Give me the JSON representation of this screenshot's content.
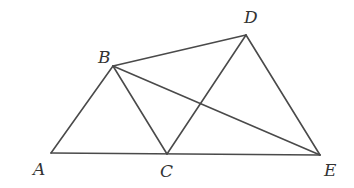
{
  "diagram": {
    "stroke_color": "#4a4a4a",
    "label_color": "#333333",
    "points": {
      "A": {
        "x": 51,
        "y": 153,
        "label": "A",
        "lx": 33,
        "ly": 175
      },
      "B": {
        "x": 113,
        "y": 66,
        "label": "B",
        "lx": 98,
        "ly": 63
      },
      "C": {
        "x": 167,
        "y": 154,
        "label": "C",
        "lx": 160,
        "ly": 177
      },
      "D": {
        "x": 246,
        "y": 35,
        "label": "D",
        "lx": 244,
        "ly": 23
      },
      "E": {
        "x": 320,
        "y": 155,
        "label": "E",
        "lx": 324,
        "ly": 176
      }
    },
    "segments": [
      [
        "A",
        "B"
      ],
      [
        "B",
        "C"
      ],
      [
        "A",
        "E"
      ],
      [
        "B",
        "D"
      ],
      [
        "B",
        "E"
      ],
      [
        "C",
        "D"
      ],
      [
        "D",
        "E"
      ]
    ]
  }
}
